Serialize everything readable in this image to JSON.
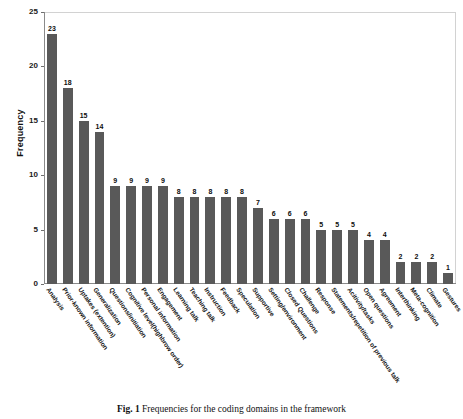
{
  "figure": {
    "caption_label": "Fig. 1",
    "caption_text": "Frequencies for the coding domains in the framework"
  },
  "chart_data": {
    "type": "bar",
    "title": "",
    "xlabel": "",
    "ylabel": "Frequency",
    "ylim": [
      0,
      25
    ],
    "yticks": [
      0,
      5,
      10,
      15,
      20,
      25
    ],
    "grid": false,
    "legend": "none",
    "bar_color": "#595959",
    "show_value_labels": true,
    "xtick_rotation": 55,
    "categories": [
      "Analysis",
      "Prior-known information",
      "Uptakes (extention)",
      "Generalization",
      "Questions/initiation",
      "Cognitive level(highbrow order)",
      "Personal information",
      "Engagement",
      "Learning talk",
      "Teaching talk",
      "Instruction",
      "Feedback",
      "Speculation",
      "Supportive",
      "Setting/environment",
      "Closed Questions",
      "Challenge",
      "Response",
      "Statements/repetition of previous talk",
      "Acitivity/tasks",
      "Open questions",
      "Agreement",
      "Interthinking",
      "Meta-cognition",
      "Climate",
      "Gestures"
    ],
    "values": [
      23,
      18,
      15,
      14,
      9,
      9,
      9,
      9,
      8,
      8,
      8,
      8,
      8,
      7,
      6,
      6,
      6,
      5,
      5,
      5,
      4,
      4,
      2,
      2,
      2,
      1
    ]
  }
}
